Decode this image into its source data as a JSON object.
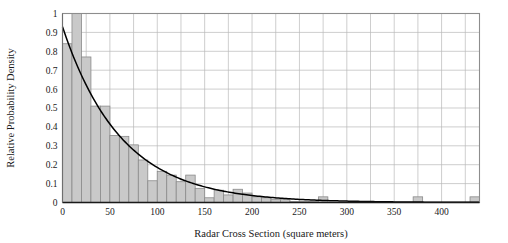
{
  "chart_data": {
    "type": "bar",
    "title": "",
    "subtitle": "",
    "xlabel": "Radar Cross Section (square meters)",
    "ylabel": "Relative Probability Density",
    "xlim": [
      0,
      440
    ],
    "ylim": [
      0,
      1
    ],
    "grid": true,
    "legend": null,
    "xticks": [
      0,
      50,
      100,
      150,
      200,
      250,
      300,
      350,
      400
    ],
    "xticklabels": [
      "0",
      "50",
      "100",
      "150",
      "200",
      "250",
      "300",
      "350",
      "400"
    ],
    "yticks": [
      0,
      0.1,
      0.2,
      0.3,
      0.4,
      0.5,
      0.6,
      0.7,
      0.8,
      0.9,
      1
    ],
    "yticklabels": [
      "0",
      "0.1",
      "0.2",
      "0.3",
      "0.4",
      "0.5",
      "0.6",
      "0.7",
      "0.8",
      "0.9",
      "1"
    ],
    "x_gridline_step": 25,
    "y_gridline_step": 0.1,
    "bin_width": 10,
    "bar_fill": "#c9c9c9",
    "bar_edge": "#8a8a8a",
    "curve_color": "#000000",
    "categories": [
      5,
      15,
      25,
      35,
      45,
      55,
      65,
      75,
      85,
      95,
      105,
      115,
      125,
      135,
      145,
      155,
      165,
      175,
      185,
      195,
      205,
      215,
      225,
      235,
      245,
      255,
      265,
      275,
      285,
      295,
      305,
      315,
      325,
      335,
      345,
      355,
      365,
      375,
      385,
      395,
      405,
      415,
      425,
      435
    ],
    "values": [
      0.84,
      1.0,
      0.77,
      0.51,
      0.51,
      0.355,
      0.35,
      0.305,
      0.225,
      0.115,
      0.165,
      0.145,
      0.11,
      0.145,
      0.075,
      0.025,
      0.065,
      0.04,
      0.07,
      0.05,
      0.03,
      0.025,
      0.015,
      0.015,
      0.005,
      0.005,
      0.005,
      0.03,
      0.0,
      0.0,
      0.0,
      0.0,
      0.0,
      0.0,
      0.0,
      0.0,
      0.0,
      0.03,
      0.0,
      0.0,
      0.0,
      0.0,
      0.0,
      0.03
    ],
    "fit_curve": {
      "name": "exponential fit",
      "form": "y = A*exp(-x/tau)",
      "amplitude": 0.93,
      "tau": 62,
      "x": [
        0,
        10,
        20,
        30,
        40,
        50,
        60,
        70,
        80,
        90,
        100,
        110,
        120,
        130,
        140,
        150,
        160,
        170,
        180,
        190,
        200,
        220,
        240,
        260,
        280,
        300,
        320,
        340,
        360,
        380,
        400,
        420,
        440
      ],
      "y": [
        0.93,
        0.79,
        0.67,
        0.57,
        0.485,
        0.41,
        0.35,
        0.297,
        0.252,
        0.214,
        0.182,
        0.155,
        0.131,
        0.111,
        0.095,
        0.08,
        0.068,
        0.058,
        0.049,
        0.042,
        0.035,
        0.026,
        0.018,
        0.013,
        0.009,
        0.007,
        0.005,
        0.0035,
        0.0025,
        0.0018,
        0.0013,
        0.0009,
        0.0006
      ]
    }
  }
}
